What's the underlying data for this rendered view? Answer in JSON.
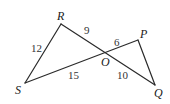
{
  "diagram": {
    "type": "geometry",
    "points": {
      "R": {
        "label": "R",
        "x": 61,
        "y": 24
      },
      "P": {
        "label": "P",
        "x": 138,
        "y": 40
      },
      "O": {
        "label": "O",
        "x": 106,
        "y": 53
      },
      "S": {
        "label": "S",
        "x": 25,
        "y": 83
      },
      "Q": {
        "label": "Q",
        "x": 155,
        "y": 85
      }
    },
    "segments": [
      {
        "from": "R",
        "to": "S",
        "length_label": "12"
      },
      {
        "from": "R",
        "to": "O",
        "length_label": "9"
      },
      {
        "from": "O",
        "to": "P",
        "length_label": "6"
      },
      {
        "from": "S",
        "to": "O",
        "length_label": "15"
      },
      {
        "from": "O",
        "to": "Q",
        "length_label": "10"
      },
      {
        "from": "P",
        "to": "Q",
        "length_label": ""
      }
    ],
    "vertex_labels": {
      "R": "R",
      "P": "P",
      "O": "O",
      "S": "S",
      "Q": "Q"
    },
    "length_labels": {
      "RS": "12",
      "RO": "9",
      "OP": "6",
      "SO": "15",
      "OQ": "10"
    }
  }
}
